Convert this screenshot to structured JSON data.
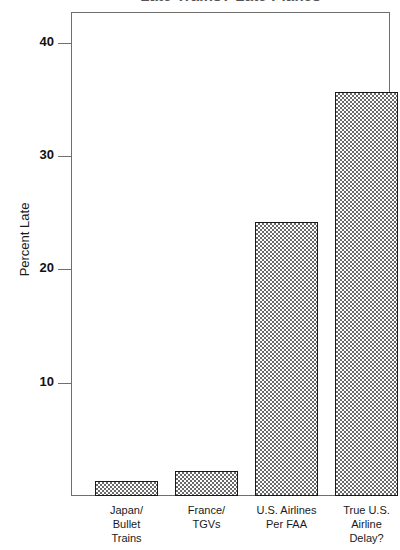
{
  "chart_data": {
    "type": "bar",
    "title": "Late Trains? Late Planes",
    "xlabel": "",
    "ylabel": "Percent Late",
    "ylim": [
      0,
      43
    ],
    "grid": false,
    "legend": "none",
    "yticks": [
      40,
      30,
      20,
      10
    ],
    "ytick_labels": [
      "40",
      "30",
      "20",
      "10"
    ],
    "categories": [
      "Japan/ Bullet Trains",
      "France/ TGVs",
      "U.S. Airlines Per FAA",
      "True U.S. Airline Delay?"
    ],
    "category_lines": [
      [
        "Japan/",
        "Bullet",
        "Trains"
      ],
      [
        "France/",
        "TGVs"
      ],
      [
        "U.S. Airlines",
        "Per FAA"
      ],
      [
        "True U.S.",
        "Airline",
        "Delay?"
      ]
    ],
    "values": [
      1.3,
      2.2,
      24.2,
      35.7
    ],
    "bar_fill": "#6a6a6a",
    "bar_edge": "#1a1a1a",
    "frame_color": "#6f6f6f",
    "text_color": "#1a1a1a"
  }
}
